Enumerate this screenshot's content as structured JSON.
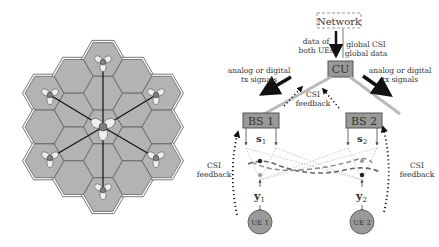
{
  "left_panel": {
    "description": "19-cell hexagonal cluster with 7 base stations, each with 3-sector antenna pattern",
    "colors": {
      "cell_fill": "#b3b3b3",
      "cell_edge": "#555555",
      "outer_edge": "#ffffff",
      "bs_node": "#808080",
      "lobe_fill": "#eeeeee",
      "backhaul": "#111111"
    }
  },
  "right_panel": {
    "network": {
      "label": "Network"
    },
    "cu": {
      "label": "CU"
    },
    "bs1": {
      "label": "BS 1",
      "signal": "s",
      "signal_sub": "1"
    },
    "bs2": {
      "label": "BS 2",
      "signal": "s",
      "signal_sub": "2"
    },
    "ue1": {
      "label": "UE 1",
      "rx": "y",
      "rx_sub": "1"
    },
    "ue2": {
      "label": "UE 2",
      "rx": "y",
      "rx_sub": "2"
    },
    "annotations": {
      "data_line1": "data of",
      "data_line2": "both UEs",
      "global_line1": "global CSI",
      "global_line2": "global data",
      "left_tx_line1": "analog or digital",
      "left_tx_line2": "tx signals",
      "right_tx_line1": "analog or digital",
      "right_tx_line2": "tx signals",
      "center_csi_line1": "CSI",
      "center_csi_line2": "feedback",
      "left_csi_line1": "CSI",
      "left_csi_line2": "feedback",
      "right_csi_line1": "CSI",
      "right_csi_line2": "feedback"
    },
    "colors": {
      "box_fill": "#999999",
      "box_edge": "#555555",
      "link": "#bbbbbb",
      "ue_fill": "#999999",
      "arrow": "#111111"
    }
  }
}
